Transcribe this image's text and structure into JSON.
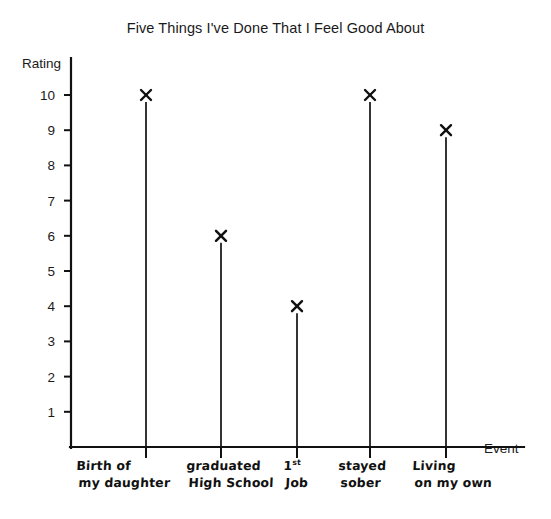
{
  "chart_data": {
    "type": "bar",
    "title": "Five Things I've Done That I Feel Good About",
    "xlabel": "Event",
    "ylabel": "Rating",
    "categories": [
      "Birth of my daughter",
      "graduated High School",
      "1st Job",
      "stayed sober",
      "Living on my own"
    ],
    "values": [
      10,
      6,
      4,
      10,
      9
    ],
    "ylim": [
      0,
      10.6
    ],
    "yticks": [
      1,
      2,
      3,
      4,
      5,
      6,
      7,
      8,
      9,
      10
    ],
    "ytick_labels": [
      "1",
      "2",
      "3",
      "4",
      "5",
      "6",
      "7",
      "8",
      "9",
      "10"
    ],
    "grid": false,
    "legend": "none",
    "marker": "x",
    "style": "hand-drawn stem plot on plain white background",
    "colors": {
      "ink": "#111111",
      "axis": "#111111",
      "background": "#ffffff"
    }
  },
  "category_labels": [
    {
      "line1": "Birth of",
      "line2": "my daughter"
    },
    {
      "line1": "graduated",
      "line2": "High School"
    },
    {
      "line1": "1st",
      "line1_sup": "st",
      "line1_base": "1",
      "line2": "Job"
    },
    {
      "line1": "stayed",
      "line2": "sober"
    },
    {
      "line1": "Living",
      "line2": "on my own"
    }
  ]
}
